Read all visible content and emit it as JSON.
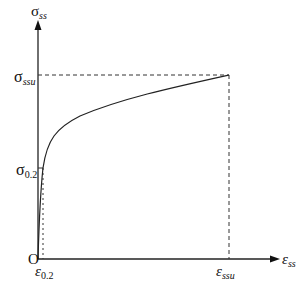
{
  "diagram": {
    "type": "stress-strain curve",
    "y_axis": {
      "symbol": "σ",
      "subscript": "ss"
    },
    "x_axis": {
      "symbol": "ε",
      "subscript": "ss"
    },
    "origin_label": "O",
    "y_marks": [
      {
        "symbol": "σ",
        "subscript": "ssu"
      },
      {
        "symbol": "σ",
        "subscript": "0.2"
      }
    ],
    "x_marks": [
      {
        "symbol": "ε",
        "subscript": "0.2"
      },
      {
        "symbol": "ε",
        "subscript": "ssu"
      }
    ],
    "colors": {
      "line": "#222222",
      "background": "#ffffff"
    }
  }
}
